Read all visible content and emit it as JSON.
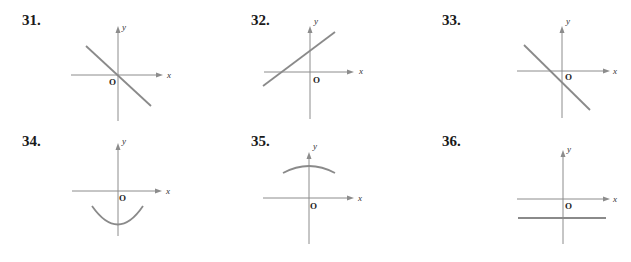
{
  "problems": [
    {
      "number": "31.",
      "x_label": "x",
      "y_label": "y",
      "origin_label": "O",
      "graph": "line through origin with negative slope"
    },
    {
      "number": "32.",
      "x_label": "x",
      "y_label": "y",
      "origin_label": "O",
      "graph": "line with positive slope and positive y-intercept"
    },
    {
      "number": "33.",
      "x_label": "x",
      "y_label": "y",
      "origin_label": "O",
      "graph": "line with negative slope and negative y-intercept"
    },
    {
      "number": "34.",
      "x_label": "x",
      "y_label": "y",
      "origin_label": "O",
      "graph": "upward-opening arc below x-axis"
    },
    {
      "number": "35.",
      "x_label": "x",
      "y_label": "y",
      "origin_label": "O",
      "graph": "downward-opening arc above x-axis"
    },
    {
      "number": "36.",
      "x_label": "x",
      "y_label": "y",
      "origin_label": "O",
      "graph": "horizontal line below x-axis"
    }
  ],
  "colors": {
    "axis": "#8c8c8c",
    "curve": "#8a8a8a",
    "text": "#1a1a1a"
  }
}
